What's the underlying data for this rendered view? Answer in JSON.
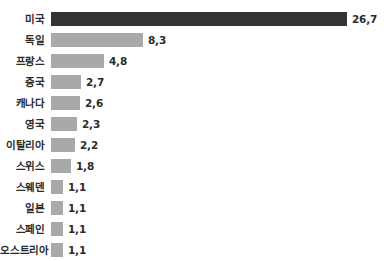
{
  "chart_data": {
    "type": "bar",
    "orientation": "horizontal",
    "title": "",
    "subtitle": "",
    "xlabel": "",
    "ylabel": "",
    "grid": false,
    "legend": false,
    "legend_position": "none",
    "axis_line": false,
    "tick_labels": [],
    "xlim": [
      0,
      26.7
    ],
    "decimal_separator": ",",
    "categories": [
      "미국",
      "독일",
      "프랑스",
      "중국",
      "캐나다",
      "영국",
      "이탈리아",
      "스위스",
      "스웨덴",
      "일본",
      "스페인",
      "오스트리아"
    ],
    "values": [
      26.7,
      8.3,
      4.8,
      2.7,
      2.6,
      2.3,
      2.2,
      1.8,
      1.1,
      1.1,
      1.1,
      1.1
    ],
    "value_labels": [
      "26,7",
      "8,3",
      "4,8",
      "2,7",
      "2,6",
      "2,3",
      "2,2",
      "1,8",
      "1,1",
      "1,1",
      "1,1",
      "1,1"
    ],
    "bars": [
      {
        "category": "미국",
        "value": 26.7,
        "label": "26,7",
        "color": "#333333",
        "highlight": true
      },
      {
        "category": "독일",
        "value": 8.3,
        "label": "8,3",
        "color": "#a9a9a9",
        "highlight": false
      },
      {
        "category": "프랑스",
        "value": 4.8,
        "label": "4,8",
        "color": "#a9a9a9",
        "highlight": false
      },
      {
        "category": "중국",
        "value": 2.7,
        "label": "2,7",
        "color": "#a9a9a9",
        "highlight": false
      },
      {
        "category": "캐나다",
        "value": 2.6,
        "label": "2,6",
        "color": "#a9a9a9",
        "highlight": false
      },
      {
        "category": "영국",
        "value": 2.3,
        "label": "2,3",
        "color": "#a9a9a9",
        "highlight": false
      },
      {
        "category": "이탈리아",
        "value": 2.2,
        "label": "2,2",
        "color": "#a9a9a9",
        "highlight": false
      },
      {
        "category": "스위스",
        "value": 1.8,
        "label": "1,8",
        "color": "#a9a9a9",
        "highlight": false
      },
      {
        "category": "스웨덴",
        "value": 1.1,
        "label": "1,1",
        "color": "#a9a9a9",
        "highlight": false
      },
      {
        "category": "일본",
        "value": 1.1,
        "label": "1,1",
        "color": "#a9a9a9",
        "highlight": false
      },
      {
        "category": "스페인",
        "value": 1.1,
        "label": "1,1",
        "color": "#a9a9a9",
        "highlight": false
      },
      {
        "category": "오스트리아",
        "value": 1.1,
        "label": "1,1",
        "color": "#a9a9a9",
        "highlight": false
      }
    ],
    "colors": {
      "bar": "#a9a9a9",
      "bar_highlight": "#333333",
      "text": "#2b2b2b",
      "background": "#ffffff"
    },
    "layout": {
      "row_pitch_px": 21,
      "first_row_top_px": 8,
      "bar_height_px": 14,
      "bar_start_x_px": 57,
      "px_per_unit": 11.1
    }
  }
}
